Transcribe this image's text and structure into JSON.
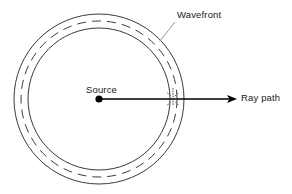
{
  "figure": {
    "background_color": "#ffffff",
    "line_color": "#3a3a3a",
    "ray_color": "#000000",
    "text_color": "#1a1a1a",
    "width": 292,
    "height": 194
  },
  "labels": {
    "wavefront": "Wavefront",
    "source": "Source",
    "ray_path": "Ray path"
  },
  "geometry": {
    "center": {
      "x": 99,
      "y": 99
    },
    "circles": [
      {
        "name": "outer-wavefront-circle",
        "radius": 85,
        "style": "solid"
      },
      {
        "name": "middle-wavefront-circle",
        "radius": 78,
        "style": "dashed"
      },
      {
        "name": "inner-wavefront-circle",
        "radius": 71,
        "style": "solid"
      }
    ],
    "source_dot_radius": 3.6,
    "ray": {
      "x1": 99,
      "y1": 99,
      "x2": 237,
      "y2": 99
    },
    "leader_line": {
      "x1": 175,
      "y1": 22,
      "x2": 160,
      "y2": 41
    },
    "intersection_marker": {
      "x": 173,
      "y": 99
    }
  }
}
